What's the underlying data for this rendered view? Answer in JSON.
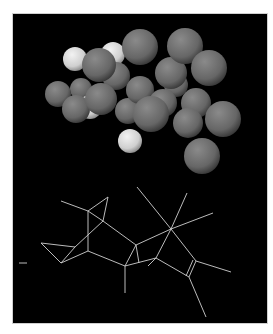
{
  "figure": {
    "caption": "Molecular model: space-filling (top) and wireframe (bottom)",
    "background": "#000000",
    "border": "#cfcfcf",
    "page_background": "#ffffff"
  },
  "space_filling_model": {
    "label": "space-filling-model",
    "heavy_atom_color": "#6a6a6a",
    "hydrogen_color": "#d8d8d8",
    "atoms": [
      {
        "type": "heavy",
        "cx": 139,
        "cy": 46,
        "r": 18
      },
      {
        "type": "heavy",
        "cx": 184,
        "cy": 45,
        "r": 18
      },
      {
        "type": "heavy",
        "cx": 208,
        "cy": 67,
        "r": 18
      },
      {
        "type": "heavy",
        "cx": 170,
        "cy": 72,
        "r": 16
      },
      {
        "type": "heavy",
        "cx": 175,
        "cy": 84,
        "r": 12
      },
      {
        "type": "heavy",
        "cx": 98,
        "cy": 64,
        "r": 17
      },
      {
        "type": "heavy",
        "cx": 115,
        "cy": 75,
        "r": 14
      },
      {
        "type": "heavy",
        "cx": 57,
        "cy": 93,
        "r": 13
      },
      {
        "type": "heavy",
        "cx": 80,
        "cy": 88,
        "r": 11
      },
      {
        "type": "heavy",
        "cx": 100,
        "cy": 98,
        "r": 16
      },
      {
        "type": "heavy",
        "cx": 75,
        "cy": 108,
        "r": 14
      },
      {
        "type": "heavy",
        "cx": 139,
        "cy": 89,
        "r": 14
      },
      {
        "type": "heavy",
        "cx": 127,
        "cy": 110,
        "r": 13
      },
      {
        "type": "heavy",
        "cx": 162,
        "cy": 102,
        "r": 14
      },
      {
        "type": "heavy",
        "cx": 150,
        "cy": 113,
        "r": 18
      },
      {
        "type": "heavy",
        "cx": 195,
        "cy": 102,
        "r": 15
      },
      {
        "type": "heavy",
        "cx": 187,
        "cy": 122,
        "r": 15
      },
      {
        "type": "heavy",
        "cx": 222,
        "cy": 118,
        "r": 18
      },
      {
        "type": "heavy",
        "cx": 201,
        "cy": 155,
        "r": 18
      },
      {
        "type": "hydrogen",
        "cx": 74,
        "cy": 58,
        "r": 12
      },
      {
        "type": "hydrogen",
        "cx": 112,
        "cy": 53,
        "r": 12
      },
      {
        "type": "hydrogen",
        "cx": 89,
        "cy": 106,
        "r": 12
      },
      {
        "type": "hydrogen",
        "cx": 129,
        "cy": 140,
        "r": 12
      }
    ]
  },
  "wireframe_model": {
    "label": "wireframe-model",
    "bond_color": "#d0d0d0",
    "bonds": [
      [
        60,
        200,
        87,
        210
      ],
      [
        87,
        210,
        107,
        196
      ],
      [
        107,
        196,
        102,
        220
      ],
      [
        102,
        220,
        87,
        210
      ],
      [
        87,
        210,
        87,
        250
      ],
      [
        87,
        250,
        60,
        262
      ],
      [
        60,
        262,
        40,
        242
      ],
      [
        40,
        242,
        74,
        246
      ],
      [
        74,
        246,
        60,
        262
      ],
      [
        102,
        220,
        74,
        246
      ],
      [
        87,
        250,
        124,
        265
      ],
      [
        124,
        265,
        135,
        244
      ],
      [
        135,
        244,
        138,
        262
      ],
      [
        102,
        220,
        135,
        244
      ],
      [
        124,
        265,
        124,
        292
      ],
      [
        124,
        265,
        155,
        257
      ],
      [
        135,
        244,
        170,
        228
      ],
      [
        170,
        228,
        136,
        186
      ],
      [
        170,
        228,
        186,
        192
      ],
      [
        170,
        228,
        212,
        212
      ],
      [
        170,
        228,
        155,
        257
      ],
      [
        155,
        257,
        147,
        265
      ],
      [
        155,
        257,
        188,
        276
      ],
      [
        170,
        228,
        195,
        260
      ],
      [
        195,
        260,
        188,
        276
      ],
      [
        192,
        259,
        185,
        275
      ],
      [
        195,
        260,
        230,
        271
      ],
      [
        188,
        276,
        205,
        316
      ],
      [
        18,
        262,
        26,
        262
      ]
    ]
  }
}
